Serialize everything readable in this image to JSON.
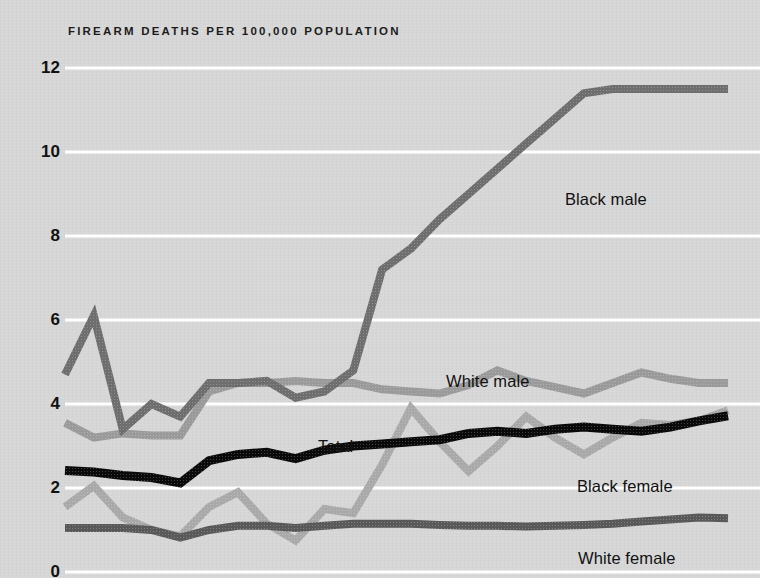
{
  "chart_data": {
    "type": "line",
    "title": "FIREARM DEATHS PER 100,000 POPULATION",
    "xlabel": "",
    "ylabel": "",
    "ylim": [
      0,
      12
    ],
    "yticks": [
      0,
      2,
      4,
      6,
      8,
      10,
      12
    ],
    "ytick_labels": [
      "0",
      "2",
      "4",
      "6",
      "8",
      "10",
      "12"
    ],
    "grid": "horizontal-white",
    "legend_position": "inline-annotations",
    "x": [
      1,
      2,
      3,
      4,
      5,
      6,
      7,
      8,
      9,
      10,
      11,
      12,
      13,
      14,
      15,
      16,
      17,
      18,
      19,
      20,
      21,
      22,
      23,
      24
    ],
    "series": [
      {
        "name": "Black male",
        "color": "#6e6e6e",
        "label_x": 565,
        "label_y": 190,
        "values": [
          4.7,
          6.1,
          3.4,
          4.0,
          3.7,
          4.5,
          4.5,
          4.55,
          4.15,
          4.3,
          4.8,
          7.2,
          7.7,
          8.4,
          9.0,
          9.6,
          10.2,
          10.8,
          11.4,
          11.5,
          11.5,
          11.5,
          11.5,
          11.5
        ]
      },
      {
        "name": "White male",
        "color": "#9a9a9a",
        "label_x": 446,
        "label_y": 372,
        "values": [
          3.55,
          3.2,
          3.3,
          3.25,
          3.25,
          4.3,
          4.5,
          4.5,
          4.55,
          4.5,
          4.5,
          4.35,
          4.3,
          4.25,
          4.45,
          4.8,
          4.55,
          4.4,
          4.25,
          4.5,
          4.75,
          4.6,
          4.5,
          4.5
        ]
      },
      {
        "name": "Total",
        "color": "#0a0a0a",
        "label_x": 318,
        "label_y": 437,
        "values": [
          2.42,
          2.38,
          2.3,
          2.25,
          2.12,
          2.65,
          2.8,
          2.85,
          2.7,
          2.9,
          3.0,
          3.05,
          3.1,
          3.15,
          3.3,
          3.35,
          3.3,
          3.4,
          3.45,
          3.4,
          3.35,
          3.45,
          3.6,
          3.72
        ]
      },
      {
        "name": "Black female",
        "color": "#a9a9a9",
        "label_x": 577,
        "label_y": 477,
        "values": [
          1.55,
          2.05,
          1.3,
          1.0,
          0.85,
          1.55,
          1.9,
          1.15,
          0.75,
          1.5,
          1.4,
          2.55,
          3.9,
          3.1,
          2.4,
          3.0,
          3.7,
          3.2,
          2.8,
          3.2,
          3.55,
          3.5,
          3.6,
          3.85
        ]
      },
      {
        "name": "White female",
        "color": "#595959",
        "label_x": 578,
        "label_y": 549,
        "values": [
          1.05,
          1.05,
          1.05,
          1.0,
          0.82,
          1.0,
          1.1,
          1.1,
          1.05,
          1.1,
          1.15,
          1.15,
          1.15,
          1.12,
          1.1,
          1.1,
          1.08,
          1.1,
          1.12,
          1.15,
          1.2,
          1.25,
          1.3,
          1.28
        ]
      }
    ]
  },
  "axis": {
    "tick_labels": [
      "12",
      "10",
      "8",
      "6",
      "4",
      "2",
      "0"
    ],
    "tick_values": [
      12,
      10,
      8,
      6,
      4,
      2,
      0
    ]
  },
  "colors": {
    "background": "#d6d6d6",
    "gridline": "#ffffff",
    "text": "#111111"
  }
}
